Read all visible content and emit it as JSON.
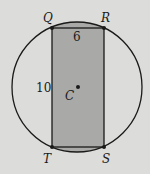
{
  "diagram": {
    "type": "circle-inscribed-rectangle",
    "colors": {
      "background": "#dcdcda",
      "shaded_fill": "#a9a9a7",
      "stroke": "#1a1a1a"
    },
    "circle": {
      "center_label": "C",
      "cx": 77,
      "cy": 87,
      "r": 65
    },
    "rectangle": {
      "vertices": [
        {
          "label": "Q",
          "x": 52,
          "y": 28
        },
        {
          "label": "R",
          "x": 104,
          "y": 28
        },
        {
          "label": "S",
          "x": 104,
          "y": 147
        },
        {
          "label": "T",
          "x": 52,
          "y": 147
        }
      ]
    },
    "measurements": {
      "top_side_label": "6",
      "left_side_label": "10"
    },
    "labels": {
      "Q": "Q",
      "R": "R",
      "S": "S",
      "T": "T",
      "C": "C"
    }
  }
}
